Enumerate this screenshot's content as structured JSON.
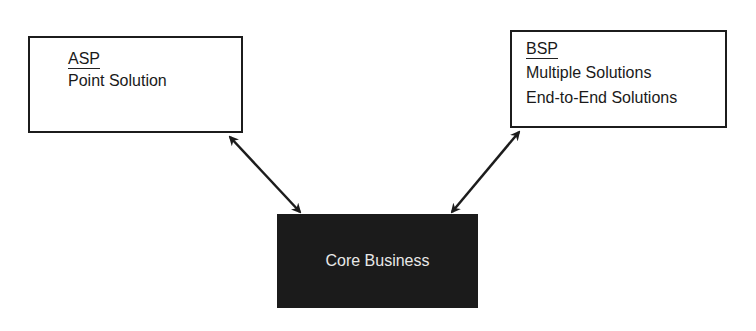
{
  "diagram": {
    "asp_box": {
      "title": "ASP",
      "lines": [
        "Point Solution"
      ]
    },
    "bsp_box": {
      "title": "BSP",
      "lines": [
        "Multiple Solutions",
        "End-to-End Solutions"
      ]
    },
    "core_box": {
      "label": "Core Business"
    },
    "connections": [
      {
        "from": "ASP",
        "to": "Core Business",
        "type": "bidirectional-arrow"
      },
      {
        "from": "BSP",
        "to": "Core Business",
        "type": "bidirectional-arrow"
      }
    ],
    "colors": {
      "line": "#1c1c1c",
      "core_fill": "#1b1b1b",
      "core_text": "#e8e8e8"
    }
  }
}
